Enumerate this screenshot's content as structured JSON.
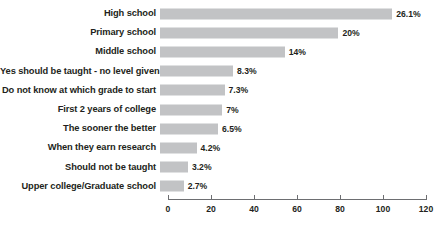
{
  "chart_data": {
    "type": "bar",
    "orientation": "horizontal",
    "title": "",
    "xlabel": "",
    "ylabel": "",
    "xlim": [
      0,
      120
    ],
    "grid": false,
    "legend": null,
    "xticks": [
      0,
      20,
      40,
      60,
      80,
      100,
      120
    ],
    "categories": [
      "High school",
      "Primary school",
      "Middle school",
      "Yes should be taught - no level given",
      "Do not know at which grade to start",
      "First 2 years of college",
      "The sooner the better",
      "When they earn research",
      "Should not be taught",
      "Upper college/Graduate school"
    ],
    "values": [
      108,
      83,
      58,
      34,
      30,
      29,
      27,
      17,
      13,
      11
    ],
    "data_labels": [
      "26.1%",
      "20%",
      "14%",
      "8.3%",
      "7.3%",
      "7%",
      "6.5%",
      "4.2%",
      "3.2%",
      "2.7%"
    ],
    "percentages": [
      26.1,
      20,
      14,
      8.3,
      7.3,
      7,
      6.5,
      4.2,
      3.2,
      2.7
    ],
    "bar_color": "#c2c3c5",
    "axis_color": "#6d6e71",
    "text_color": "#231f20"
  },
  "footnote": {
    "text": ""
  }
}
